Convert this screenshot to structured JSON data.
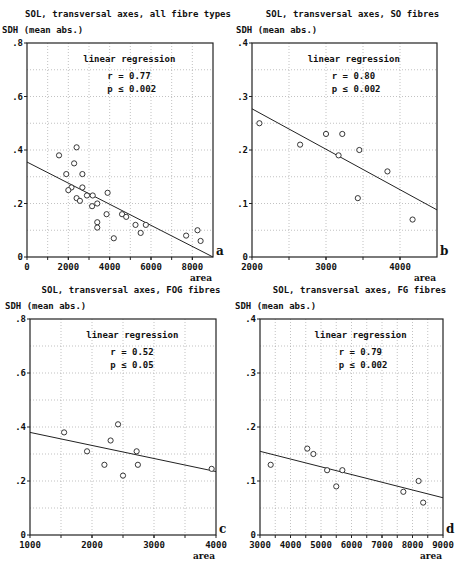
{
  "chart_data": [
    {
      "id": "a",
      "type": "scatter",
      "title": "SOL, transversal axes, all fibre types",
      "ylabel": "SDH (mean abs.)",
      "xlabel": "area",
      "panel_letter": "a",
      "annotation": {
        "heading": "linear regression",
        "r": "r = 0.77",
        "p": "p ≤ 0.002"
      },
      "xlim": [
        0,
        9000
      ],
      "ylim": [
        0,
        0.8
      ],
      "xticks": [
        0,
        2000,
        4000,
        6000,
        8000
      ],
      "xtick_labels": [
        "0",
        "2000",
        "4000",
        "6000",
        "8000"
      ],
      "xgrid": [
        1000,
        2000,
        3000,
        4000,
        5000,
        6000,
        7000,
        8000
      ],
      "yticks": [
        0,
        0.2,
        0.4,
        0.6,
        0.8
      ],
      "ytick_labels": [
        "0",
        ".2",
        ".4",
        ".6",
        ".8"
      ],
      "ygrid": [
        0.1,
        0.2,
        0.3,
        0.4,
        0.5,
        0.6,
        0.7
      ],
      "grid": true,
      "regression": {
        "x": [
          0,
          9000
        ],
        "y": [
          0.355,
          0.0
        ]
      },
      "points": [
        [
          1550,
          0.38
        ],
        [
          2400,
          0.41
        ],
        [
          2280,
          0.35
        ],
        [
          1900,
          0.31
        ],
        [
          2680,
          0.31
        ],
        [
          2150,
          0.26
        ],
        [
          2680,
          0.26
        ],
        [
          2000,
          0.25
        ],
        [
          2400,
          0.22
        ],
        [
          2560,
          0.21
        ],
        [
          2900,
          0.23
        ],
        [
          3180,
          0.23
        ],
        [
          3150,
          0.19
        ],
        [
          3400,
          0.2
        ],
        [
          3900,
          0.24
        ],
        [
          3400,
          0.13
        ],
        [
          3400,
          0.11
        ],
        [
          3850,
          0.16
        ],
        [
          4200,
          0.07
        ],
        [
          4600,
          0.16
        ],
        [
          4800,
          0.15
        ],
        [
          5250,
          0.12
        ],
        [
          5500,
          0.09
        ],
        [
          5750,
          0.12
        ],
        [
          7700,
          0.08
        ],
        [
          8250,
          0.1
        ],
        [
          8400,
          0.06
        ]
      ]
    },
    {
      "id": "b",
      "type": "scatter",
      "title": "SOL, transversal axes, SO fibres",
      "ylabel": "SDH (mean abs.)",
      "xlabel": "area",
      "panel_letter": "b",
      "annotation": {
        "heading": "linear regression",
        "r": "r = 0.80",
        "p": "p ≤ 0.002"
      },
      "xlim": [
        2000,
        4500
      ],
      "ylim": [
        0,
        0.4
      ],
      "xticks": [
        2000,
        3000,
        4000
      ],
      "xtick_labels": [
        "2000",
        "3000",
        "4000"
      ],
      "xgrid": [
        2500,
        3000,
        3500,
        4000
      ],
      "yticks": [
        0,
        0.1,
        0.2,
        0.3,
        0.4
      ],
      "ytick_labels": [
        "0",
        ".1",
        ".2",
        ".3",
        ".4"
      ],
      "ygrid": [
        0.05,
        0.1,
        0.15,
        0.2,
        0.25,
        0.3,
        0.35
      ],
      "grid": true,
      "regression": {
        "x": [
          2000,
          4500
        ],
        "y": [
          0.277,
          0.088
        ]
      },
      "points": [
        [
          2100,
          0.25
        ],
        [
          2650,
          0.21
        ],
        [
          3000,
          0.23
        ],
        [
          3220,
          0.23
        ],
        [
          3170,
          0.19
        ],
        [
          3450,
          0.2
        ],
        [
          3430,
          0.11
        ],
        [
          3830,
          0.16
        ],
        [
          4170,
          0.07
        ]
      ]
    },
    {
      "id": "c",
      "type": "scatter",
      "title": "SOL, transversal axes, FOG fibres",
      "ylabel": "SDH (mean abs.)",
      "xlabel": "area",
      "panel_letter": "c",
      "annotation": {
        "heading": "linear regression",
        "r": "r = 0.52",
        "p": "p ≤ 0.05"
      },
      "xlim": [
        1000,
        4000
      ],
      "ylim": [
        0,
        0.8
      ],
      "xticks": [
        1000,
        2000,
        3000,
        4000
      ],
      "xtick_labels": [
        "1000",
        "2000",
        "3000",
        "4000"
      ],
      "xgrid": [
        1500,
        2000,
        2500,
        3000,
        3500
      ],
      "yticks": [
        0,
        0.2,
        0.4,
        0.6,
        0.8
      ],
      "ytick_labels": [
        "0",
        ".2",
        ".4",
        ".6",
        ".8"
      ],
      "ygrid": [
        0.1,
        0.2,
        0.3,
        0.4,
        0.5,
        0.6,
        0.7
      ],
      "grid": true,
      "regression": {
        "x": [
          1000,
          4000
        ],
        "y": [
          0.38,
          0.235
        ]
      },
      "points": [
        [
          1550,
          0.38
        ],
        [
          1920,
          0.31
        ],
        [
          2200,
          0.26
        ],
        [
          2300,
          0.35
        ],
        [
          2420,
          0.41
        ],
        [
          2500,
          0.22
        ],
        [
          2720,
          0.31
        ],
        [
          2740,
          0.26
        ],
        [
          3930,
          0.245
        ]
      ]
    },
    {
      "id": "d",
      "type": "scatter",
      "title": "SOL, transversal axes, FG fibres",
      "ylabel": "SDH (mean abs.)",
      "xlabel": "area",
      "panel_letter": "d",
      "annotation": {
        "heading": "linear regression",
        "r": "r = 0.79",
        "p": "p ≤ 0.002"
      },
      "xlim": [
        3000,
        9000
      ],
      "ylim": [
        0,
        0.4
      ],
      "xticks": [
        3000,
        4000,
        5000,
        6000,
        7000,
        8000,
        9000
      ],
      "xtick_labels": [
        "3000",
        "4000",
        "5000",
        "6000",
        "7000",
        "8000",
        "9000"
      ],
      "xgrid": [
        3500,
        4000,
        4500,
        5000,
        5500,
        6000,
        6500,
        7000,
        7500,
        8000,
        8500
      ],
      "yticks": [
        0,
        0.1,
        0.2,
        0.3,
        0.4
      ],
      "ytick_labels": [
        "0",
        ".1",
        ".2",
        ".3",
        ".4"
      ],
      "ygrid": [
        0.05,
        0.1,
        0.15,
        0.2,
        0.25,
        0.3,
        0.35
      ],
      "grid": true,
      "regression": {
        "x": [
          3000,
          9000
        ],
        "y": [
          0.155,
          0.069
        ]
      },
      "points": [
        [
          3350,
          0.13
        ],
        [
          4550,
          0.16
        ],
        [
          4750,
          0.15
        ],
        [
          5200,
          0.12
        ],
        [
          5500,
          0.09
        ],
        [
          5700,
          0.12
        ],
        [
          7700,
          0.08
        ],
        [
          8200,
          0.1
        ],
        [
          8350,
          0.06
        ]
      ]
    }
  ]
}
